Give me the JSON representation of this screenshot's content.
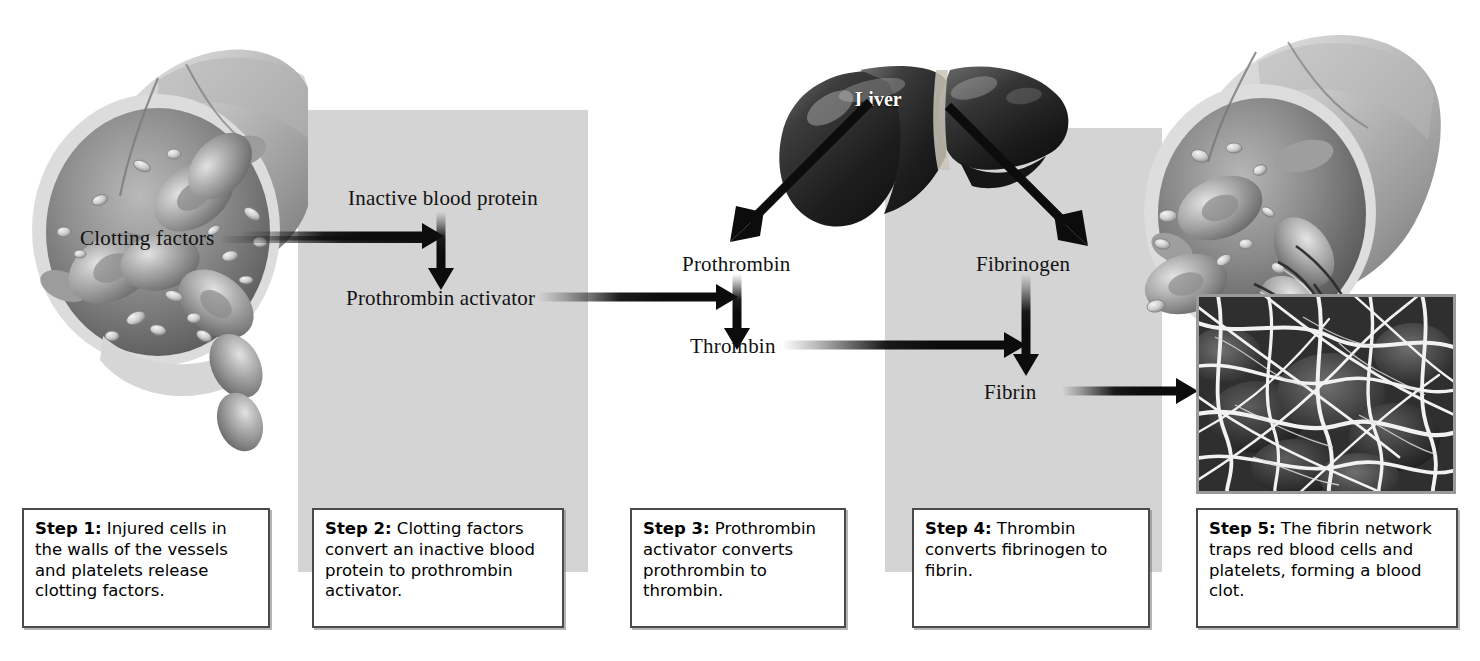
{
  "figure": {
    "panels": [
      {
        "id": "panel-step2"
      },
      {
        "id": "panel-step4"
      }
    ]
  },
  "illustrations": {
    "vessel_left": {
      "name": "injured-blood-vessel-cutaway"
    },
    "vessel_right": {
      "name": "blood-vessel-with-fibrin-clot"
    },
    "liver": {
      "name": "liver-organ",
      "label": "Liver"
    },
    "micrograph": {
      "name": "fibrin-network-micrograph"
    }
  },
  "labels": {
    "clotting_factors": "Clotting factors",
    "inactive_blood_protein": "Inactive blood protein",
    "prothrombin_activator": "Prothrombin activator",
    "prothrombin": "Prothrombin",
    "thrombin": "Thrombin",
    "fibrinogen": "Fibrinogen",
    "fibrin": "Fibrin",
    "liver": "Liver"
  },
  "steps": [
    {
      "lead": "Step 1:",
      "text": " Injured cells in the walls of the vessels and platelets release clotting factors."
    },
    {
      "lead": "Step 2:",
      "text": " Clotting factors convert an inactive blood protein to prothrombin activator."
    },
    {
      "lead": "Step 3:",
      "text": " Prothrombin activator converts prothrombin to thrombin."
    },
    {
      "lead": "Step 4:",
      "text": " Thrombin converts fibrinogen to fibrin."
    },
    {
      "lead": "Step 5:",
      "text": " The fibrin network traps red blood cells and platelets, forming a blood clot."
    }
  ],
  "colors": {
    "panel_gray": "#d4d4d4",
    "arrow_black": "#0c0c0c",
    "caption_border": "#4a4a4a",
    "page_background": "#ffffff"
  }
}
